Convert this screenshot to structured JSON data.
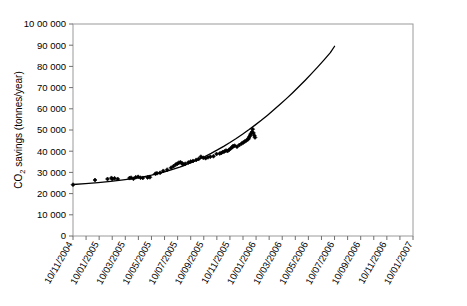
{
  "chart_data": {
    "type": "scatter",
    "title": "",
    "subtitle": "",
    "xlabel": "",
    "ylabel": "CO2 savings (tonnes/year)",
    "ylabel_display": "CO₂ savings (tonnes/year)",
    "ylim": [
      0,
      100000
    ],
    "ytick_labels": [
      "10 00 000",
      "90 000",
      "80 000",
      "70 000",
      "60 000",
      "50 000",
      "40 000",
      "30 000",
      "20 000",
      "10 000",
      "0"
    ],
    "ytick_values": [
      100000,
      90000,
      80000,
      70000,
      60000,
      50000,
      40000,
      30000,
      20000,
      10000,
      0
    ],
    "xtick_labels": [
      "10/11/2004",
      "10/01/2005",
      "10/03/2005",
      "10/05/2005",
      "10/07/2005",
      "10/09/2005",
      "10/11/2005",
      "10/01/2006",
      "10/03/2006",
      "10/05/2006",
      "10/07/2006",
      "10/09/2006",
      "10/11/2006",
      "10/01/2007"
    ],
    "xlim_label_start": "10/11/2004",
    "xlim_label_end": "10/01/2007",
    "grid": false,
    "legend": false,
    "legend_position": "none",
    "series": [
      {
        "name": "Fitted trend",
        "type": "line",
        "color": "#000000",
        "points": [
          [
            0.0,
            24300
          ],
          [
            0.08,
            24700
          ],
          [
            0.16,
            25200
          ],
          [
            0.24,
            25800
          ],
          [
            0.32,
            26500
          ],
          [
            0.38,
            27100
          ],
          [
            0.44,
            27800
          ],
          [
            0.5,
            28700
          ],
          [
            0.55,
            29600
          ],
          [
            0.6,
            30600
          ],
          [
            0.64,
            31500
          ],
          [
            0.68,
            32500
          ],
          [
            0.72,
            33600
          ],
          [
            0.76,
            34800
          ],
          [
            0.8,
            36100
          ],
          [
            0.84,
            37500
          ],
          [
            0.88,
            39000
          ],
          [
            0.92,
            40600
          ],
          [
            0.96,
            42300
          ],
          [
            1.0,
            44100
          ],
          [
            1.04,
            46000
          ],
          [
            1.08,
            48000
          ],
          [
            1.12,
            50100
          ],
          [
            1.16,
            52300
          ],
          [
            1.2,
            54600
          ],
          [
            1.24,
            57000
          ],
          [
            1.28,
            59500
          ],
          [
            1.32,
            62100
          ],
          [
            1.36,
            64800
          ],
          [
            1.4,
            67600
          ],
          [
            1.44,
            70500
          ],
          [
            1.48,
            73500
          ],
          [
            1.52,
            76600
          ],
          [
            1.56,
            79800
          ],
          [
            1.6,
            83100
          ],
          [
            1.64,
            86500
          ],
          [
            1.667,
            89500
          ]
        ]
      },
      {
        "name": "Measured CO2 savings",
        "type": "scatter",
        "color": "#000000",
        "marker": "diamond",
        "points": [
          [
            0.0,
            24200
          ],
          [
            0.14,
            26400
          ],
          [
            0.22,
            26900
          ],
          [
            0.245,
            27400
          ],
          [
            0.25,
            26900
          ],
          [
            0.265,
            27200
          ],
          [
            0.285,
            26900
          ],
          [
            0.36,
            27300
          ],
          [
            0.37,
            27500
          ],
          [
            0.385,
            27000
          ],
          [
            0.4,
            27700
          ],
          [
            0.415,
            27900
          ],
          [
            0.43,
            27500
          ],
          [
            0.445,
            27400
          ],
          [
            0.475,
            27600
          ],
          [
            0.49,
            27700
          ],
          [
            0.525,
            29400
          ],
          [
            0.535,
            29600
          ],
          [
            0.555,
            29800
          ],
          [
            0.575,
            30700
          ],
          [
            0.6,
            31300
          ],
          [
            0.625,
            32200
          ],
          [
            0.64,
            32900
          ],
          [
            0.655,
            33700
          ],
          [
            0.665,
            34100
          ],
          [
            0.675,
            34600
          ],
          [
            0.685,
            34800
          ],
          [
            0.695,
            34300
          ],
          [
            0.7,
            33900
          ],
          [
            0.715,
            34100
          ],
          [
            0.735,
            34700
          ],
          [
            0.75,
            35100
          ],
          [
            0.765,
            35400
          ],
          [
            0.785,
            35900
          ],
          [
            0.8,
            36300
          ],
          [
            0.815,
            37400
          ],
          [
            0.83,
            36900
          ],
          [
            0.845,
            36700
          ],
          [
            0.86,
            37100
          ],
          [
            0.875,
            37400
          ],
          [
            0.895,
            37600
          ],
          [
            0.915,
            38700
          ],
          [
            0.935,
            38900
          ],
          [
            0.945,
            39200
          ],
          [
            0.955,
            39600
          ],
          [
            0.965,
            39900
          ],
          [
            0.975,
            40300
          ],
          [
            0.985,
            40100
          ],
          [
            0.995,
            40700
          ],
          [
            1.005,
            41300
          ],
          [
            1.015,
            41900
          ],
          [
            1.02,
            42400
          ],
          [
            1.03,
            42600
          ],
          [
            1.045,
            42100
          ],
          [
            1.06,
            42900
          ],
          [
            1.075,
            43600
          ],
          [
            1.085,
            44100
          ],
          [
            1.095,
            44600
          ],
          [
            1.105,
            45100
          ],
          [
            1.115,
            45600
          ],
          [
            1.12,
            46200
          ],
          [
            1.125,
            46900
          ],
          [
            1.13,
            47600
          ],
          [
            1.135,
            48300
          ],
          [
            1.14,
            49000
          ],
          [
            1.145,
            50400
          ],
          [
            1.15,
            48600
          ],
          [
            1.155,
            47400
          ],
          [
            1.16,
            46500
          ]
        ]
      }
    ]
  },
  "axes": {
    "y_axis_title": "CO₂ savings (tonnes/year)",
    "y_axis_title_parts": {
      "prefix": "CO",
      "subscript": "2",
      "suffix": " savings (tonnes/year)"
    }
  }
}
